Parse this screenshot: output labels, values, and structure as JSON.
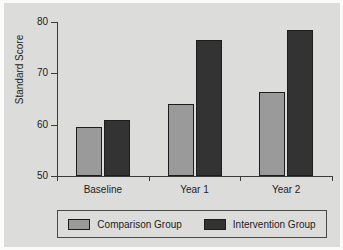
{
  "chart_data": {
    "type": "bar",
    "title": "",
    "xlabel": "",
    "ylabel": "Standard Score",
    "categories": [
      "Baseline",
      "Year 1",
      "Year 2"
    ],
    "series": [
      {
        "name": "Comparison Group",
        "color": "#9a9a9a",
        "values": [
          59.5,
          64.0,
          66.3
        ]
      },
      {
        "name": "Intervention Group",
        "color": "#333333",
        "values": [
          61.0,
          76.5,
          78.5
        ]
      }
    ],
    "ylim": [
      50,
      80
    ],
    "yticks": [
      50,
      60,
      70,
      80
    ],
    "ytick_labels": [
      "50",
      "60",
      "70",
      "80"
    ],
    "grid": false,
    "legend_position": "bottom"
  },
  "colors": {
    "panel_background": "#dcdcda",
    "figure_background": "#fbfbfa",
    "axis": "#3b3b3b",
    "text": "#1c1c1c",
    "comparison": "#9a9a9a",
    "intervention": "#333333"
  }
}
